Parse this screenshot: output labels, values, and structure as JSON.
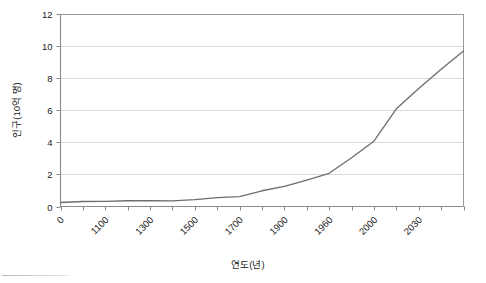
{
  "chart_data": {
    "type": "line",
    "title": "",
    "xlabel": "연도(년)",
    "ylabel": "인구(10억 명)",
    "grid": true,
    "legend": false,
    "ylim": [
      0,
      12
    ],
    "yticks": [
      0,
      2,
      4,
      6,
      8,
      10,
      12
    ],
    "ytick_labels": [
      "0",
      "2",
      "4",
      "6",
      "8",
      "10",
      "12"
    ],
    "xtick_labels": [
      "0",
      "1100",
      "1300",
      "1500",
      "1700",
      "1900",
      "1960",
      "2000",
      "2030"
    ],
    "xtick_label_positions": [
      0,
      2,
      4,
      6,
      8,
      10,
      12,
      14,
      16
    ],
    "xtick_count": 19,
    "x": [
      0,
      1000,
      1100,
      1200,
      1300,
      1400,
      1500,
      1600,
      1700,
      1800,
      1850,
      1900,
      1930,
      1960,
      1975,
      2000,
      2015,
      2030,
      2050
    ],
    "values": [
      0.25,
      0.31,
      0.32,
      0.36,
      0.36,
      0.35,
      0.43,
      0.55,
      0.62,
      0.98,
      1.26,
      1.65,
      2.07,
      3.04,
      4.07,
      6.09,
      7.35,
      8.55,
      9.7
    ],
    "series": [
      {
        "name": "세계 인구",
        "color": "#6e6e6e",
        "values": [
          0.25,
          0.31,
          0.32,
          0.36,
          0.36,
          0.35,
          0.43,
          0.55,
          0.62,
          0.98,
          1.26,
          1.65,
          2.07,
          3.04,
          4.07,
          6.09,
          7.35,
          8.55,
          9.7
        ]
      }
    ]
  },
  "colors": {
    "line": "#6e6e6e",
    "grid": "#c9c9c9",
    "axis": "#8a8a8a",
    "text": "#1a1a1a",
    "background": "#ffffff"
  }
}
